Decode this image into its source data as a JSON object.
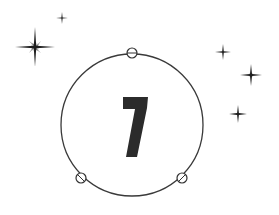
{
  "figure": {
    "number": "7",
    "colors": {
      "background": "#ffffff",
      "ink": "#2b2b2b",
      "circle_stroke": "#3a3a3a",
      "star": "#1e1e1e"
    },
    "circle": {
      "cx": 132,
      "cy": 125,
      "r": 71
    },
    "markers": [
      {
        "name": "top-marker",
        "cx": 132,
        "cy": 53,
        "r": 5
      },
      {
        "name": "bottom-left-marker",
        "cx": 81,
        "cy": 178,
        "r": 5
      },
      {
        "name": "bottom-right-marker",
        "cx": 182,
        "cy": 178,
        "r": 5
      }
    ],
    "stars": [
      {
        "name": "large-sparkle",
        "cx": 35,
        "cy": 47,
        "size": 20
      },
      {
        "name": "small-sparkle-top",
        "cx": 62,
        "cy": 18,
        "size": 6
      },
      {
        "name": "sparkle-right-1",
        "cx": 223,
        "cy": 52,
        "size": 8
      },
      {
        "name": "sparkle-right-2",
        "cx": 251,
        "cy": 75,
        "size": 11
      },
      {
        "name": "sparkle-right-3",
        "cx": 238,
        "cy": 114,
        "size": 9
      }
    ]
  }
}
